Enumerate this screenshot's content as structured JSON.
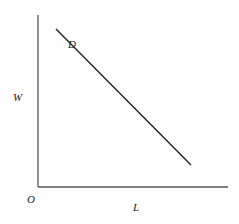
{
  "diagram": {
    "type": "line-graph",
    "axes": {
      "origin_label": "O",
      "x_label": "L",
      "y_label": "W"
    },
    "curves": [
      {
        "name": "D",
        "label": "D",
        "shape": "straight line, downward sloping",
        "color": "#222222"
      }
    ],
    "colors": {
      "axis": "#555555",
      "curve": "#222222",
      "text": "#222222"
    }
  }
}
